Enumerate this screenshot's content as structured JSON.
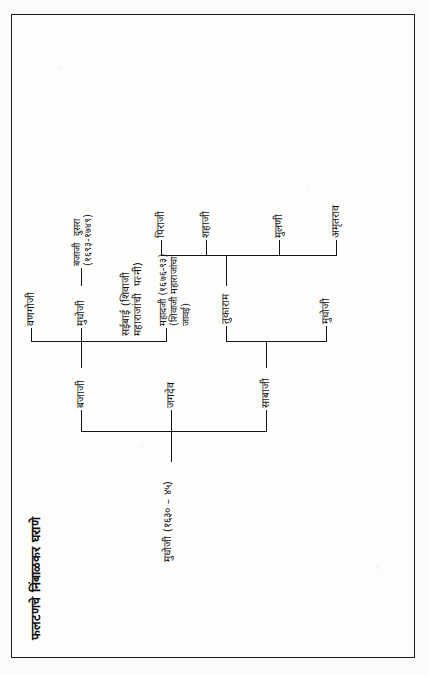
{
  "document": {
    "title": "फलटणचे निंबाळकर घराणे",
    "script": "Devanagari",
    "orientation": "rotated-90-ccw"
  },
  "tree": {
    "root": {
      "id": "mudhoji-1",
      "label": "मुधोजी (१६३० – ४५)"
    },
    "nodes": [
      {
        "id": "sabaji",
        "label": "साबाजी"
      },
      {
        "id": "jagdev",
        "label": "जगदेव"
      },
      {
        "id": "bajaji",
        "label": "बजाजी"
      },
      {
        "id": "mudhoji-2",
        "label": "मुधोजी"
      },
      {
        "id": "tukaram",
        "label": "तुकाराम"
      },
      {
        "id": "saibai",
        "label": "सईबाई (शिवाजी\nमहाराजांची  पत्नी)"
      },
      {
        "id": "mahadji",
        "label": "महादजी (१६७६-९३)\n(शिवाजी महाराजांचा\nजावई)"
      },
      {
        "id": "vanagoji",
        "label": "वणगोजी"
      },
      {
        "id": "mudhoji-3",
        "label": "मुधोजी"
      },
      {
        "id": "bajaji-dusra",
        "label": "बजाजी  दुसरा\n(१६९३-१७४९)"
      },
      {
        "id": "amrutrao",
        "label": "अमृतराव"
      },
      {
        "id": "mulani",
        "label": "मुलणी"
      },
      {
        "id": "shahaji",
        "label": "शहाजी"
      },
      {
        "id": "piraji",
        "label": "पिराजी"
      }
    ],
    "edges": [
      {
        "from": "mudhoji-1",
        "to": "sabaji"
      },
      {
        "from": "mudhoji-1",
        "to": "jagdev"
      },
      {
        "from": "mudhoji-1",
        "to": "bajaji"
      },
      {
        "from": "sabaji",
        "to": "mudhoji-2"
      },
      {
        "from": "sabaji",
        "to": "tukaram"
      },
      {
        "from": "bajaji",
        "to": "saibai"
      },
      {
        "from": "bajaji",
        "to": "mahadji"
      },
      {
        "from": "bajaji",
        "to": "vanagoji"
      },
      {
        "from": "bajaji",
        "to": "mudhoji-3"
      },
      {
        "from": "mudhoji-3",
        "to": "bajaji-dusra"
      },
      {
        "from": "tukaram",
        "to": "amrutrao"
      },
      {
        "from": "tukaram",
        "to": "mulani"
      },
      {
        "from": "tukaram",
        "to": "shahaji"
      },
      {
        "from": "tukaram",
        "to": "piraji"
      }
    ]
  },
  "colors": {
    "ink": "#151515",
    "paper": "#fdfdfc",
    "border": "#1b1b1b"
  }
}
